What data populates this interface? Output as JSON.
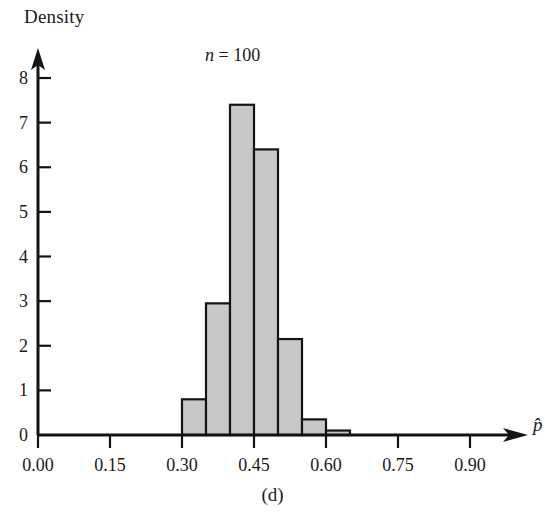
{
  "figure": {
    "caption": "(d)",
    "annotation_prefix": "n",
    "annotation_equals": " = ",
    "annotation_value": "100",
    "y_axis_title": "Density",
    "x_axis_variable": "p̂"
  },
  "chart_data": {
    "type": "bar",
    "title": "",
    "subtitle": "n = 100",
    "xlabel": "p̂",
    "ylabel": "Density",
    "grid": false,
    "legend": "none",
    "bin_width": 0.05,
    "bin_edges": [
      0.3,
      0.35,
      0.4,
      0.45,
      0.5,
      0.55,
      0.6,
      0.65
    ],
    "categories": [
      "0.30-0.35",
      "0.35-0.40",
      "0.40-0.45",
      "0.45-0.50",
      "0.50-0.55",
      "0.55-0.60",
      "0.60-0.65"
    ],
    "values": [
      0.8,
      2.95,
      7.4,
      6.4,
      2.15,
      0.35,
      0.1
    ],
    "xlim": [
      0.0,
      0.96
    ],
    "ylim": [
      0,
      8
    ],
    "x_tick_values": [
      0.0,
      0.15,
      0.3,
      0.45,
      0.6,
      0.75,
      0.9
    ],
    "x_tick_labels": [
      "0.00",
      "0.15",
      "0.30",
      "0.45",
      "0.60",
      "0.75",
      "0.90"
    ],
    "y_tick_values": [
      0,
      1,
      2,
      3,
      4,
      5,
      6,
      7,
      8
    ],
    "y_tick_labels": [
      "0",
      "1",
      "2",
      "3",
      "4",
      "5",
      "6",
      "7",
      "8"
    ],
    "bar_fill_color": "#c8c8c8",
    "bar_edge_color": "#141414",
    "axis_color": "#141414",
    "background_color": "#ffffff"
  }
}
